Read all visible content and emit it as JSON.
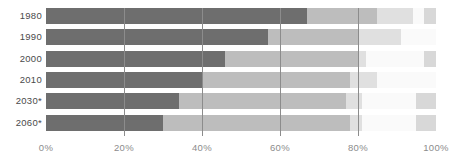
{
  "chart": {
    "title": "",
    "note": "",
    "axis_y_label": "",
    "axis_x_label": ""
  },
  "chart_data": {
    "type": "bar",
    "orientation": "horizontal",
    "stacked": true,
    "normalized_percent": true,
    "title": "",
    "xlabel": "",
    "ylabel": "",
    "xlim": [
      0,
      100
    ],
    "grid": true,
    "legend_position": "none",
    "xticks": [
      0,
      20,
      40,
      60,
      80,
      100
    ],
    "xticklabels": [
      "0%",
      "20%",
      "40%",
      "60%",
      "80%",
      "100%"
    ],
    "categories": [
      "1980",
      "1990",
      "2000",
      "2010",
      "2030*",
      "2060*"
    ],
    "series": [
      {
        "name": "segment-1",
        "color": "#6e6e6e",
        "values": [
          67,
          57,
          46,
          40,
          34,
          30
        ]
      },
      {
        "name": "segment-2",
        "color": "#bdbdbd",
        "values": [
          18,
          23,
          34,
          38,
          43,
          48
        ]
      },
      {
        "name": "segment-3",
        "color": "#e0e0e0",
        "values": [
          9,
          11,
          2,
          7,
          4,
          3
        ]
      },
      {
        "name": "segment-4",
        "color": "#fafafa",
        "values": [
          3,
          9,
          15,
          15,
          14,
          14
        ]
      },
      {
        "name": "segment-5",
        "color": "#d8d8d8",
        "values": [
          3,
          0,
          3,
          0,
          5,
          5
        ]
      }
    ],
    "bars": [
      {
        "category": "1980",
        "segments": [
          67,
          18,
          9,
          3,
          3
        ]
      },
      {
        "category": "1990",
        "segments": [
          57,
          23,
          11,
          9,
          0
        ]
      },
      {
        "category": "2000",
        "segments": [
          46,
          34,
          2,
          15,
          3
        ]
      },
      {
        "category": "2010",
        "segments": [
          40,
          38,
          7,
          15,
          0
        ]
      },
      {
        "category": "2030*",
        "segments": [
          34,
          43,
          4,
          14,
          5
        ]
      },
      {
        "category": "2060*",
        "segments": [
          30,
          48,
          3,
          14,
          5
        ]
      }
    ]
  },
  "colors": {
    "segment_1": "#6e6e6e",
    "segment_2": "#bdbdbd",
    "segment_3": "#e0e0e0",
    "segment_4": "#fafafa",
    "segment_5": "#d8d8d8",
    "gridline": "#8c8c8c",
    "tick_label": "#8c8c8c",
    "category_label": "#4a4a4a",
    "background": "#ffffff"
  }
}
